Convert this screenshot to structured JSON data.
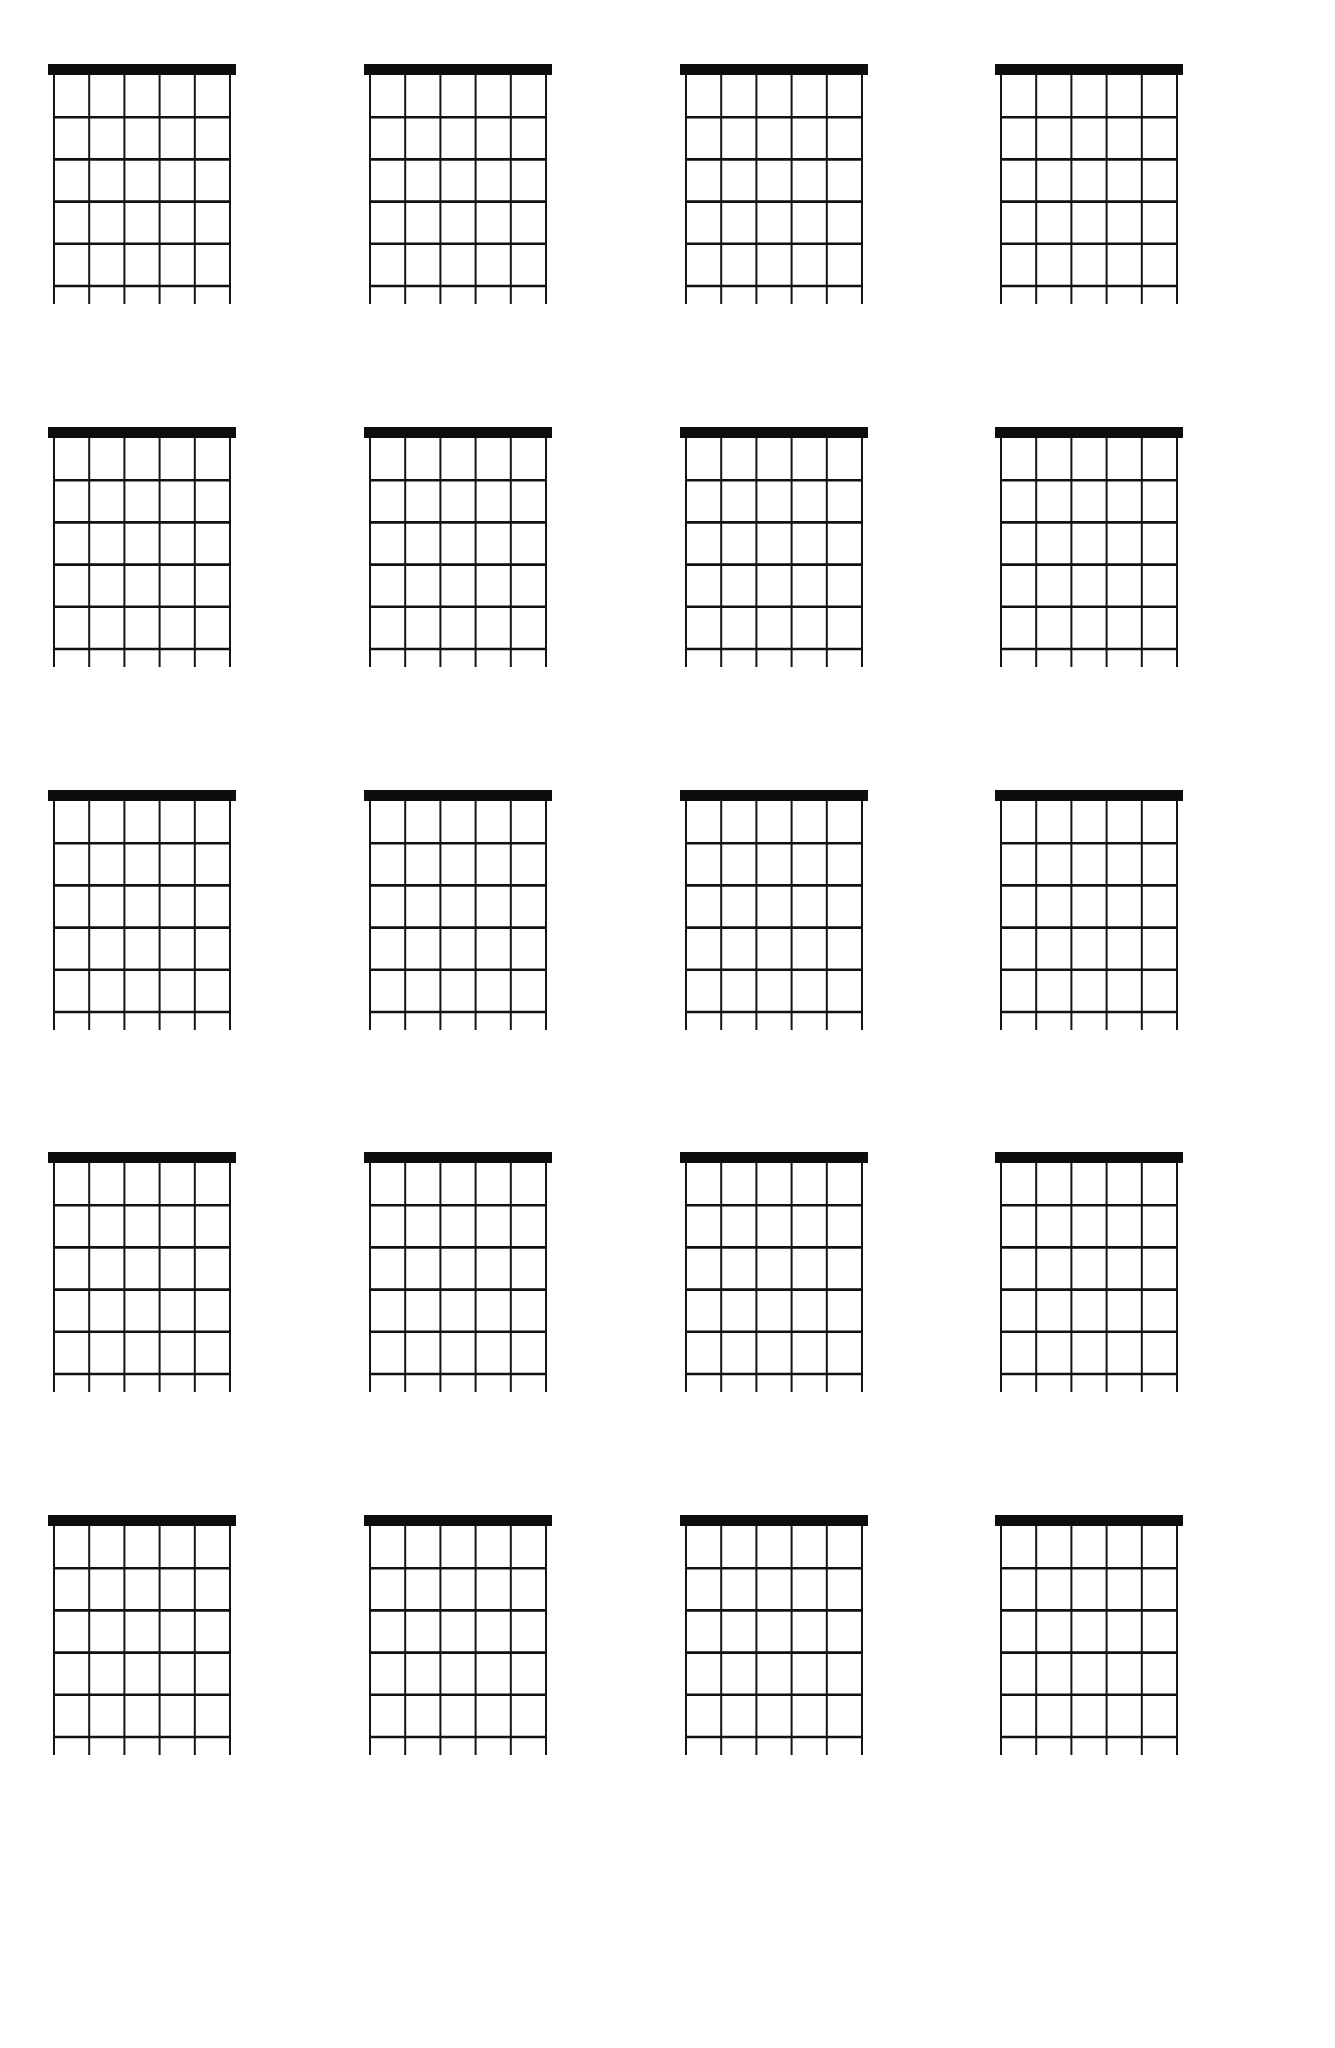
{
  "document": {
    "title": "Blank Guitar Chord Chart",
    "page_kind": "blank-chord-diagram-worksheet",
    "background_color": "#ffffff",
    "ink_color": "#111111",
    "width_px": 1335,
    "height_px": 2048
  },
  "layout": {
    "columns": 4,
    "rows": 5,
    "total_diagrams": 20
  },
  "diagram_template": {
    "name": "guitar-chord-diagram",
    "strings": 6,
    "frets": 5,
    "nut": {
      "present": true,
      "label": "nut",
      "color": "#0d0d0d",
      "thickness_px": 11
    },
    "fret_line_color": "#111111",
    "string_line_color": "#141414",
    "string_tail_px": 18,
    "board_width_px": 176,
    "board_height_px": 240
  },
  "diagrams": [
    {
      "index": 1,
      "row": 1,
      "col": 1,
      "label": "chord-diagram-1",
      "filled": false
    },
    {
      "index": 2,
      "row": 1,
      "col": 2,
      "label": "chord-diagram-2",
      "filled": false
    },
    {
      "index": 3,
      "row": 1,
      "col": 3,
      "label": "chord-diagram-3",
      "filled": false
    },
    {
      "index": 4,
      "row": 1,
      "col": 4,
      "label": "chord-diagram-4",
      "filled": false
    },
    {
      "index": 5,
      "row": 2,
      "col": 1,
      "label": "chord-diagram-5",
      "filled": false
    },
    {
      "index": 6,
      "row": 2,
      "col": 2,
      "label": "chord-diagram-6",
      "filled": false
    },
    {
      "index": 7,
      "row": 2,
      "col": 3,
      "label": "chord-diagram-7",
      "filled": false
    },
    {
      "index": 8,
      "row": 2,
      "col": 4,
      "label": "chord-diagram-8",
      "filled": false
    },
    {
      "index": 9,
      "row": 3,
      "col": 1,
      "label": "chord-diagram-9",
      "filled": false
    },
    {
      "index": 10,
      "row": 3,
      "col": 2,
      "label": "chord-diagram-10",
      "filled": false
    },
    {
      "index": 11,
      "row": 3,
      "col": 3,
      "label": "chord-diagram-11",
      "filled": false
    },
    {
      "index": 12,
      "row": 3,
      "col": 4,
      "label": "chord-diagram-12",
      "filled": false
    },
    {
      "index": 13,
      "row": 4,
      "col": 1,
      "label": "chord-diagram-13",
      "filled": false
    },
    {
      "index": 14,
      "row": 4,
      "col": 2,
      "label": "chord-diagram-14",
      "filled": false
    },
    {
      "index": 15,
      "row": 4,
      "col": 3,
      "label": "chord-diagram-15",
      "filled": false
    },
    {
      "index": 16,
      "row": 4,
      "col": 4,
      "label": "chord-diagram-16",
      "filled": false
    },
    {
      "index": 17,
      "row": 5,
      "col": 1,
      "label": "chord-diagram-17",
      "filled": false
    },
    {
      "index": 18,
      "row": 5,
      "col": 2,
      "label": "chord-diagram-18",
      "filled": false
    },
    {
      "index": 19,
      "row": 5,
      "col": 3,
      "label": "chord-diagram-19",
      "filled": false
    },
    {
      "index": 20,
      "row": 5,
      "col": 4,
      "label": "chord-diagram-20",
      "filled": false
    }
  ]
}
